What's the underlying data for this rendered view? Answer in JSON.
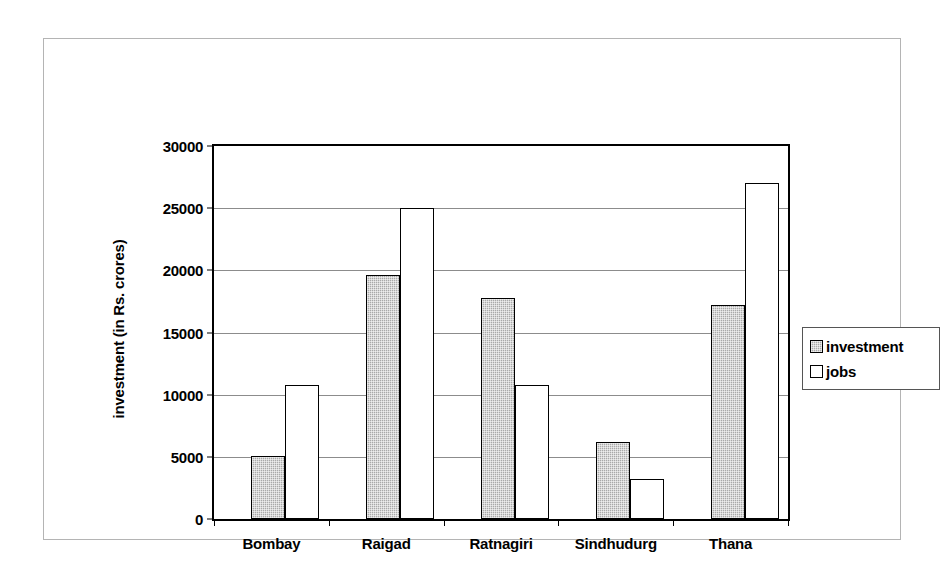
{
  "chart_data": {
    "type": "bar",
    "title": "",
    "xlabel": "",
    "ylabel": "investment (in Rs. crores)",
    "categories": [
      "Bombay",
      "Raigad",
      "Ratnagiri",
      "Sindhudurg",
      "Thana"
    ],
    "series": [
      {
        "name": "investment",
        "values": [
          5100,
          19600,
          17800,
          6200,
          17200
        ],
        "color": "#a9a9a9"
      },
      {
        "name": "jobs",
        "values": [
          10800,
          25000,
          10800,
          3200,
          27000
        ],
        "color": "#ffffff"
      }
    ],
    "ylim": [
      0,
      30000
    ],
    "ytick_labels": [
      "30000",
      "25000",
      "20000",
      "15000",
      "10000",
      "5000",
      "0"
    ],
    "ytick_values": [
      30000,
      25000,
      20000,
      15000,
      10000,
      5000,
      0
    ],
    "grid": true,
    "legend_position": "right"
  },
  "legend": {
    "entries": [
      {
        "label": "investment",
        "swatch": "gray-hatched-square-icon"
      },
      {
        "label": "jobs",
        "swatch": "white-square-icon"
      }
    ]
  }
}
